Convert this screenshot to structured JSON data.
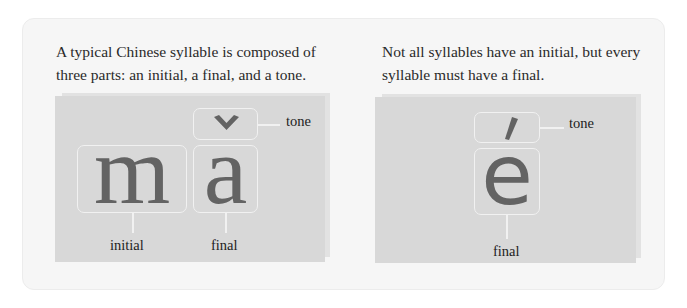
{
  "left": {
    "caption_line1": "A typical Chinese syllable is composed of",
    "caption_line2": "three parts: an initial, a final, and a tone.",
    "syllable": "mǎ",
    "parts": {
      "initial": {
        "glyph": "m",
        "label": "initial"
      },
      "final": {
        "glyph": "a",
        "label": "final"
      },
      "tone": {
        "mark": "ˇ",
        "label": "tone"
      }
    }
  },
  "right": {
    "caption_line1": "Not all syllables have an initial, but every",
    "caption_line2": "syllable must have a final.",
    "syllable": "é",
    "parts": {
      "final": {
        "glyph": "e",
        "label": "final"
      },
      "tone": {
        "mark": "ˊ",
        "label": "tone"
      }
    }
  },
  "colors": {
    "card_bg": "#f6f6f6",
    "panel_bg": "#d8d8d8",
    "glyph": "#636363",
    "box_outline": "#f1f1f1",
    "text": "#222222"
  }
}
